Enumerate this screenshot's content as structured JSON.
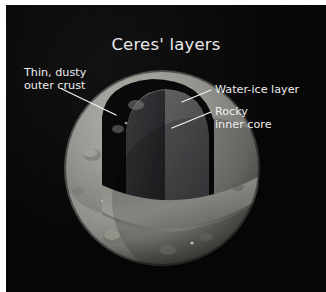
{
  "figure": {
    "title": "Ceres' layers",
    "background_color": "#050505",
    "text_color": "#eeeeee",
    "border_color": "#ffffff"
  },
  "callouts": [
    {
      "id": "crust",
      "label": "Thin, dusty\nouter crust"
    },
    {
      "id": "ice",
      "label": "Water-ice layer"
    },
    {
      "id": "core",
      "label": "Rocky\ninner core"
    }
  ],
  "diagram": {
    "type": "cutaway-sphere",
    "subject": "Ceres",
    "layers": [
      {
        "name": "outer-crust",
        "label": "Thin, dusty outer crust",
        "color": "#8d8d8a"
      },
      {
        "name": "water-ice-layer",
        "label": "Water-ice layer",
        "color": "#9b9b97"
      },
      {
        "name": "rocky-inner-core",
        "label": "Rocky inner core",
        "color": "#4a4a4c"
      }
    ]
  }
}
